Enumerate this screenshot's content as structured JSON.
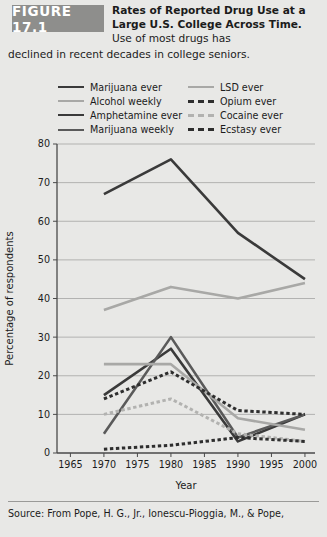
{
  "figure": {
    "badge": "FIGURE 17.1",
    "caption_bold": "Rates of Reported Drug Use at a Large U.S. College Across Time.",
    "caption_rest": " Use of most drugs has",
    "caption_tail": "declined in recent decades in college seniors."
  },
  "source": {
    "text": "Source: From Pope, H. G., Jr., Ionescu-Pioggia, M., & Pope,"
  },
  "colors": {
    "dark": "#3a3a3a",
    "mid": "#6f6f6f",
    "light": "#a8a8a6",
    "lighter": "#bdbdbb",
    "axis": "#4a4a4a",
    "grid": "#9b9b99",
    "background": "#e8e8e6",
    "badge": "#8e8e8c"
  },
  "legend": {
    "left": [
      {
        "label": "Marijuana ever",
        "color": "#3a3a3a",
        "style": "solid"
      },
      {
        "label": "Alcohol weekly",
        "color": "#a8a8a6",
        "style": "solid"
      },
      {
        "label": "Amphetamine ever",
        "color": "#3a3a3a",
        "style": "solid"
      },
      {
        "label": "Marijuana weekly",
        "color": "#5a5a5a",
        "style": "solid"
      }
    ],
    "right": [
      {
        "label": "LSD ever",
        "color": "#a8a8a6",
        "style": "solid"
      },
      {
        "label": "Opium ever",
        "color": "#2e2e2e",
        "style": "dash"
      },
      {
        "label": "Cocaine ever",
        "color": "#b2b2b0",
        "style": "dash"
      },
      {
        "label": "Ecstasy ever",
        "color": "#2e2e2e",
        "style": "dash"
      }
    ]
  },
  "chart_data": {
    "type": "line",
    "title": "Rates of Reported Drug Use at a Large U.S. College Across Time",
    "xlabel": "Year",
    "ylabel": "Percentage of respondents",
    "x": [
      1970,
      1975,
      1980,
      1985,
      1990,
      1995,
      2000
    ],
    "xlim": [
      1963,
      2001.5
    ],
    "ylim": [
      0,
      80
    ],
    "xticks": [
      1965,
      1970,
      1975,
      1980,
      1985,
      1990,
      1995,
      2000
    ],
    "yticks": [
      0,
      10,
      20,
      30,
      40,
      50,
      60,
      70,
      80
    ],
    "grid": "horizontal",
    "legend_position": "above-plot",
    "series": [
      {
        "name": "Marijuana ever",
        "color": "#3a3a3a",
        "style": "solid",
        "width": 2.6,
        "x": [
          1970,
          1980,
          1990,
          2000
        ],
        "values": [
          67,
          76,
          57,
          45
        ]
      },
      {
        "name": "Alcohol weekly",
        "color": "#a8a8a6",
        "style": "solid",
        "width": 2.6,
        "x": [
          1970,
          1980,
          1990,
          2000
        ],
        "values": [
          37,
          43,
          40,
          44
        ]
      },
      {
        "name": "Amphetamine ever",
        "color": "#3a3a3a",
        "style": "solid",
        "width": 2.6,
        "x": [
          1970,
          1980,
          1990,
          2000
        ],
        "values": [
          15,
          27,
          3,
          10
        ]
      },
      {
        "name": "Marijuana weekly",
        "color": "#5a5a5a",
        "style": "solid",
        "width": 2.6,
        "x": [
          1970,
          1980,
          1990,
          2000
        ],
        "values": [
          5,
          30,
          4,
          10
        ]
      },
      {
        "name": "LSD ever",
        "color": "#a8a8a6",
        "style": "solid",
        "width": 2.6,
        "x": [
          1970,
          1980,
          1990,
          2000
        ],
        "values": [
          23,
          23,
          9,
          6
        ]
      },
      {
        "name": "Opium ever",
        "color": "#2e2e2e",
        "style": "dash",
        "width": 3.0,
        "x": [
          1970,
          1980,
          1990,
          2000
        ],
        "values": [
          14,
          21,
          11,
          10
        ]
      },
      {
        "name": "Cocaine ever",
        "color": "#b2b2b0",
        "style": "dash",
        "width": 3.0,
        "x": [
          1970,
          1980,
          1990,
          2000
        ],
        "values": [
          10,
          14,
          5,
          3
        ]
      },
      {
        "name": "Ecstasy ever",
        "color": "#2e2e2e",
        "style": "dash",
        "width": 3.0,
        "x": [
          1970,
          1980,
          1990,
          2000
        ],
        "values": [
          1,
          2,
          4,
          3
        ]
      }
    ]
  }
}
